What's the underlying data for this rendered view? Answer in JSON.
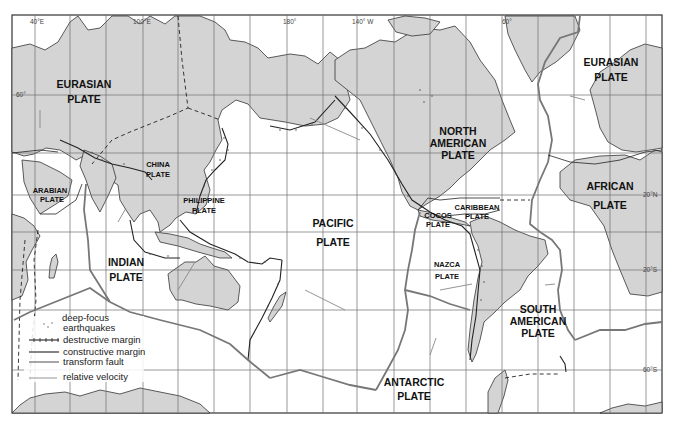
{
  "map": {
    "title": "Global Tectonic Plates",
    "longitude_labels": [
      {
        "text": "40°E",
        "x": 30,
        "y": 24
      },
      {
        "text": "100°E",
        "x": 133,
        "y": 24
      },
      {
        "text": "180°",
        "x": 283,
        "y": 24
      },
      {
        "text": "140° W",
        "x": 352,
        "y": 24
      },
      {
        "text": "60°",
        "x": 502,
        "y": 24
      }
    ],
    "latitude_labels": [
      {
        "text": "60°",
        "x": 16,
        "y": 97
      },
      {
        "text": "20°N",
        "x": 643,
        "y": 197
      },
      {
        "text": "20°S",
        "x": 643,
        "y": 272
      },
      {
        "text": "60°S",
        "x": 643,
        "y": 372
      }
    ],
    "plates": {
      "eurasian_west": {
        "line1": "EURASIAN",
        "line2": "PLATE"
      },
      "eurasian_east": {
        "line1": "EURASIAN",
        "line2": "PLATE"
      },
      "arabian": {
        "line1": "ARABIAN",
        "line2": "PLATE"
      },
      "china": {
        "line1": "CHINA",
        "line2": "PLATE"
      },
      "philippine": {
        "line1": "PHILIPPINE",
        "line2": "PLATE"
      },
      "indian": {
        "line1": "INDIAN",
        "line2": "PLATE"
      },
      "pacific": {
        "line1": "PACIFIC",
        "line2": "PLATE"
      },
      "north_american": {
        "line1": "NORTH",
        "line2": "AMERICAN",
        "line3": "PLATE"
      },
      "cocos": {
        "line1": "COCOS",
        "line2": "PLATE"
      },
      "caribbean": {
        "line1": "CARIBBEAN",
        "line2": "PLATE"
      },
      "nazca": {
        "line1": "NAZCA",
        "line2": "PLATE"
      },
      "african": {
        "line1": "AFRICAN",
        "line2": "PLATE"
      },
      "south_american": {
        "line1": "SOUTH",
        "line2": "AMERICAN",
        "line3": "PLATE"
      },
      "antarctic": {
        "line1": "ANTARCTIC",
        "line2": "PLATE"
      }
    },
    "legend": {
      "deep_focus": "deep-focus",
      "earthquakes": "earthquakes",
      "destructive": "destructive margin",
      "constructive": "constructive margin",
      "transform": "transform fault",
      "velocity": "relative velocity"
    },
    "colors": {
      "land": "#d4d4d4",
      "ocean": "#ffffff",
      "grid": "#6e6e6e",
      "boundary": "#222222",
      "constructive": "#777777"
    }
  }
}
